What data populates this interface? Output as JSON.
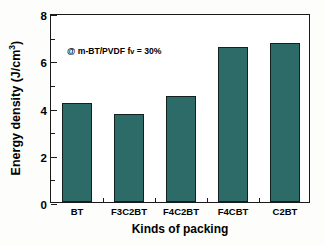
{
  "chart_data": {
    "type": "bar",
    "title": "",
    "subtitle": "",
    "categories": [
      "BT",
      "F3C2BT",
      "F4C2BT",
      "F4CBT",
      "C2BT"
    ],
    "values": [
      4.2,
      3.72,
      4.5,
      6.55,
      6.75
    ],
    "series": [
      {
        "name": "Energy density",
        "values": [
          4.2,
          3.72,
          4.5,
          6.55,
          6.75
        ]
      }
    ],
    "xlabel": "Kinds of packing",
    "ylabel_prefix": "Energy density (J/cm",
    "ylabel_superscript": "3",
    "ylabel_suffix": ")",
    "ylabel_plain": "Energy density (J/cm3)",
    "ylim": [
      0,
      8
    ],
    "ytick_labels": [
      "0",
      "2",
      "4",
      "6",
      "8"
    ],
    "ytick_values": [
      0,
      2,
      4,
      6,
      8
    ],
    "yminor_values": [
      1,
      3,
      5,
      7
    ],
    "grid": false,
    "legend": null,
    "bar_color": "#2d6b68",
    "bar_edge_color": "#12201f",
    "axis_color": "#1a1a1a",
    "background_color": "#ffffff",
    "annotations": [
      {
        "text_prefix": "@ m-BT/PVDF f",
        "text_sub": "v",
        "text_suffix": " = 30%",
        "text_plain": "@ m-BT/PVDF fv = 30%"
      }
    ]
  }
}
